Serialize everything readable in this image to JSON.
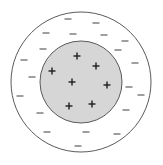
{
  "diagram": {
    "colors": {
      "background": "#ffffff",
      "outer_circle_stroke": "#5a5a5a",
      "inner_circle_fill": "#d6d6d6",
      "inner_circle_stroke": "#5a5a5a",
      "plus_color": "#1e1e1e",
      "minus_color": "#5e5e5e"
    },
    "outer_circle": {
      "cx": 81,
      "cy": 82,
      "r": 70
    },
    "inner_circle": {
      "cx": 81,
      "cy": 82,
      "r": 41
    },
    "plus_symbol": "+",
    "minus_symbol": "−",
    "plus_charges": [
      {
        "x": 77,
        "y": 56
      },
      {
        "x": 96,
        "y": 66
      },
      {
        "x": 52,
        "y": 71
      },
      {
        "x": 72,
        "y": 82
      },
      {
        "x": 107,
        "y": 85
      },
      {
        "x": 69,
        "y": 106
      },
      {
        "x": 92,
        "y": 104
      }
    ],
    "minus_charges": [
      {
        "x": 68,
        "y": 19
      },
      {
        "x": 96,
        "y": 23
      },
      {
        "x": 46,
        "y": 33
      },
      {
        "x": 73,
        "y": 34
      },
      {
        "x": 104,
        "y": 35
      },
      {
        "x": 125,
        "y": 41
      },
      {
        "x": 43,
        "y": 49
      },
      {
        "x": 118,
        "y": 50
      },
      {
        "x": 24,
        "y": 60
      },
      {
        "x": 135,
        "y": 63
      },
      {
        "x": 32,
        "y": 77
      },
      {
        "x": 129,
        "y": 87
      },
      {
        "x": 20,
        "y": 96
      },
      {
        "x": 141,
        "y": 95
      },
      {
        "x": 40,
        "y": 113
      },
      {
        "x": 126,
        "y": 110
      },
      {
        "x": 47,
        "y": 132
      },
      {
        "x": 86,
        "y": 132
      },
      {
        "x": 117,
        "y": 134
      },
      {
        "x": 78,
        "y": 146
      }
    ],
    "counts": {
      "plus": 7,
      "minus": 20
    }
  }
}
